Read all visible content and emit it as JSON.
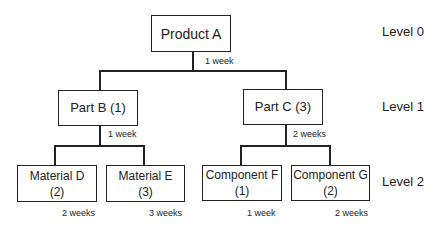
{
  "diagram": {
    "type": "bill-of-materials-tree",
    "nodes": [
      {
        "id": "product-a",
        "label": "Product A",
        "level": 0
      },
      {
        "id": "part-b",
        "label": "Part B (1)",
        "level": 1
      },
      {
        "id": "part-c",
        "label": "Part C (3)",
        "level": 1
      },
      {
        "id": "material-d",
        "label": "Material D",
        "qty": "(2)",
        "level": 2
      },
      {
        "id": "material-e",
        "label": "Material E",
        "qty": "(3)",
        "level": 2
      },
      {
        "id": "component-f",
        "label": "Component F",
        "qty": "(1)",
        "level": 2
      },
      {
        "id": "component-g",
        "label": "Component G",
        "qty": "(2)",
        "level": 2
      }
    ],
    "lead_times": {
      "product_a": "1 week",
      "part_b": "1 week",
      "part_c": "2 weeks",
      "material_d": "2 weeks",
      "material_e": "3 weeks",
      "component_f": "1 week",
      "component_g": "2 weeks"
    },
    "levels": [
      "Level 0",
      "Level 1",
      "Level 2"
    ]
  }
}
